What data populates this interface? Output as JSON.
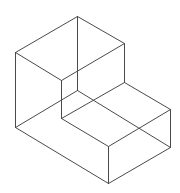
{
  "diagram": {
    "title": "",
    "type": "isometric-wireframe",
    "stroke_color": "#4a4a4a",
    "background": "#ffffff",
    "vertices": {
      "top": [
        77,
        16
      ],
      "left_top": [
        15,
        52
      ],
      "right_top": [
        124,
        43
      ],
      "inner_front_top": [
        61,
        80
      ],
      "hidden_center": [
        77,
        90
      ],
      "step_corner": [
        124,
        82
      ],
      "lower_right_top": [
        170,
        109
      ],
      "inner_front_bottom": [
        61,
        118
      ],
      "front_step_top": [
        108,
        146
      ],
      "left_bottom": [
        15,
        127
      ],
      "bottom": [
        108,
        183
      ],
      "lower_right_bottom": [
        170,
        147
      ]
    },
    "edges": [
      [
        "top",
        "left_top"
      ],
      [
        "top",
        "right_top"
      ],
      [
        "left_top",
        "inner_front_top"
      ],
      [
        "right_top",
        "inner_front_top"
      ],
      [
        "top",
        "hidden_center"
      ],
      [
        "left_top",
        "left_bottom"
      ],
      [
        "right_top",
        "step_corner"
      ],
      [
        "inner_front_top",
        "inner_front_bottom"
      ],
      [
        "step_corner",
        "lower_right_top"
      ],
      [
        "step_corner",
        "inner_front_bottom"
      ],
      [
        "inner_front_bottom",
        "front_step_top"
      ],
      [
        "lower_right_top",
        "front_step_top"
      ],
      [
        "lower_right_top",
        "lower_right_bottom"
      ],
      [
        "front_step_top",
        "bottom"
      ],
      [
        "left_bottom",
        "bottom"
      ],
      [
        "bottom",
        "lower_right_bottom"
      ],
      [
        "left_bottom",
        "hidden_center"
      ],
      [
        "hidden_center",
        "lower_right_bottom"
      ]
    ]
  }
}
